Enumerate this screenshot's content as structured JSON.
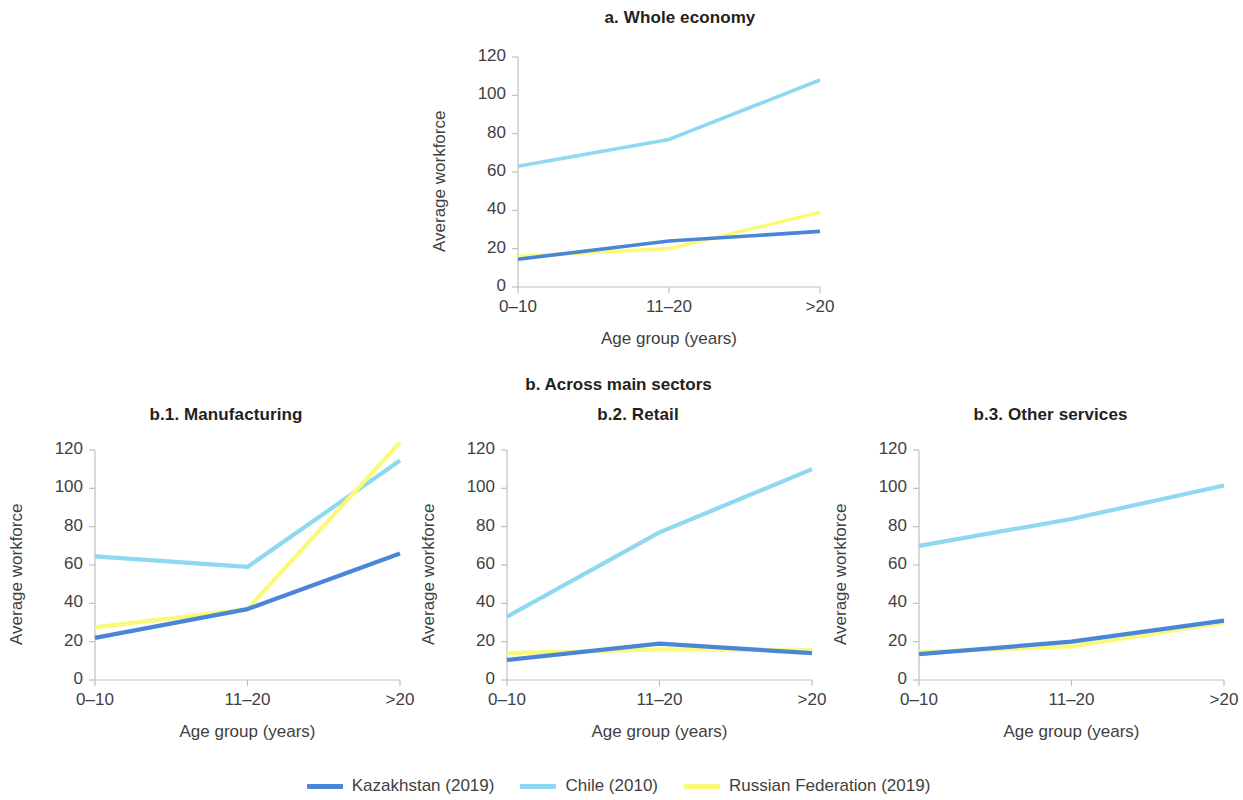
{
  "figure": {
    "section_b_title": "b. Across main sectors",
    "axis": {
      "ylabel": "Average workforce",
      "xlabel": "Age group (years)",
      "yticks": [
        "0",
        "20",
        "40",
        "60",
        "80",
        "100",
        "120"
      ],
      "ytick_values": [
        0,
        20,
        40,
        60,
        80,
        100,
        120
      ],
      "xticks": [
        "0–10",
        "11–20",
        ">20"
      ],
      "ylim": [
        0,
        120
      ]
    },
    "legend": [
      {
        "name": "Kazakhstan (2019)",
        "color": "#4a86d8"
      },
      {
        "name": "Chile (2010)",
        "color": "#8ed8f2"
      },
      {
        "name": "Russian Federation (2019)",
        "color": "#fafa78"
      }
    ]
  },
  "chart_data": [
    {
      "type": "line",
      "title": "a. Whole economy",
      "xlabel": "Age group (years)",
      "ylabel": "Average workforce",
      "categories": [
        "0–10",
        "11–20",
        ">20"
      ],
      "ylim": [
        0,
        120
      ],
      "grid": false,
      "legend_position": "bottom",
      "series": [
        {
          "name": "Kazakhstan (2019)",
          "color": "#4a86d8",
          "values": [
            14.5,
            24.0,
            29.0
          ]
        },
        {
          "name": "Chile (2010)",
          "color": "#8ed8f2",
          "values": [
            63.0,
            77.0,
            108.0
          ]
        },
        {
          "name": "Russian Federation (2019)",
          "color": "#fafa78",
          "values": [
            16.0,
            20.0,
            39.0
          ]
        }
      ]
    },
    {
      "type": "line",
      "title": "b.1. Manufacturing",
      "xlabel": "Age group (years)",
      "ylabel": "Average workforce",
      "categories": [
        "0–10",
        "11–20",
        ">20"
      ],
      "ylim": [
        0,
        120
      ],
      "grid": false,
      "legend_position": "bottom",
      "series": [
        {
          "name": "Kazakhstan (2019)",
          "color": "#4a86d8",
          "values": [
            22.0,
            37.0,
            66.0
          ]
        },
        {
          "name": "Chile (2010)",
          "color": "#8ed8f2",
          "values": [
            64.5,
            59.0,
            114.5
          ]
        },
        {
          "name": "Russian Federation (2019)",
          "color": "#fafa78",
          "values": [
            27.5,
            37.0,
            124.0
          ]
        }
      ]
    },
    {
      "type": "line",
      "title": "b.2. Retail",
      "xlabel": "Age group (years)",
      "ylabel": "Average workforce",
      "categories": [
        "0–10",
        "11–20",
        ">20"
      ],
      "ylim": [
        0,
        120
      ],
      "grid": false,
      "legend_position": "bottom",
      "series": [
        {
          "name": "Kazakhstan (2019)",
          "color": "#4a86d8",
          "values": [
            10.5,
            19.0,
            14.0
          ]
        },
        {
          "name": "Chile (2010)",
          "color": "#8ed8f2",
          "values": [
            33.0,
            77.0,
            110.0
          ]
        },
        {
          "name": "Russian Federation (2019)",
          "color": "#fafa78",
          "values": [
            14.0,
            16.0,
            15.5
          ]
        }
      ]
    },
    {
      "type": "line",
      "title": "b.3. Other services",
      "xlabel": "Age group (years)",
      "ylabel": "Average workforce",
      "categories": [
        "0–10",
        "11–20",
        ">20"
      ],
      "ylim": [
        0,
        120
      ],
      "grid": false,
      "legend_position": "bottom",
      "series": [
        {
          "name": "Kazakhstan (2019)",
          "color": "#4a86d8",
          "values": [
            13.5,
            20.0,
            31.0
          ]
        },
        {
          "name": "Chile (2010)",
          "color": "#8ed8f2",
          "values": [
            70.0,
            84.0,
            101.5
          ]
        },
        {
          "name": "Russian Federation (2019)",
          "color": "#fafa78",
          "values": [
            14.5,
            17.5,
            30.0
          ]
        }
      ]
    }
  ]
}
